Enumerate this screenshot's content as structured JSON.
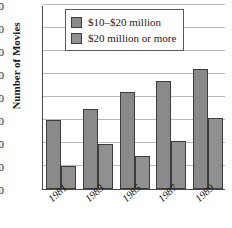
{
  "chart_data": {
    "type": "bar",
    "title": "",
    "xlabel": "",
    "ylabel": "Number of Movies",
    "categories": [
      "1981",
      "1983",
      "1985",
      "1987",
      "1989"
    ],
    "series": [
      {
        "name": "$10–$20 million",
        "values": [
          30,
          35,
          42,
          47,
          52
        ],
        "color": "#8a8a8a"
      },
      {
        "name": "$20 million or more",
        "values": [
          10,
          19.5,
          14.5,
          21,
          31
        ],
        "color": "#909090"
      }
    ],
    "ylim": [
      0,
      80
    ],
    "yticks": [
      0,
      10,
      20,
      30,
      40,
      50,
      60,
      70,
      80
    ],
    "grid": true,
    "legend_position": "top-center"
  },
  "legend": {
    "items": [
      {
        "label": "$10–$20 million"
      },
      {
        "label": "$20 million or more"
      }
    ]
  }
}
